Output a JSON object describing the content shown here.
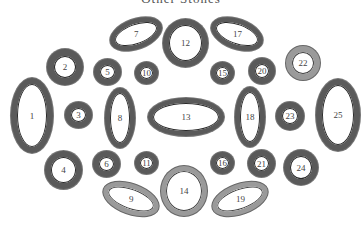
{
  "title": "Other Stones",
  "rings": [
    {
      "id": "1",
      "label": "1"
    },
    {
      "id": "2",
      "label": "2"
    },
    {
      "id": "3",
      "label": "3"
    },
    {
      "id": "4",
      "label": "4"
    },
    {
      "id": "5",
      "label": "5"
    },
    {
      "id": "6",
      "label": "6"
    },
    {
      "id": "7",
      "label": "7"
    },
    {
      "id": "8",
      "label": "8"
    },
    {
      "id": "9",
      "label": "9"
    },
    {
      "id": "10",
      "label": "10"
    },
    {
      "id": "11",
      "label": "11"
    },
    {
      "id": "12",
      "label": "12"
    },
    {
      "id": "13",
      "label": "13"
    },
    {
      "id": "14",
      "label": "14"
    },
    {
      "id": "15",
      "label": "15"
    },
    {
      "id": "16",
      "label": "16"
    },
    {
      "id": "17",
      "label": "17"
    },
    {
      "id": "18",
      "label": "18"
    },
    {
      "id": "19",
      "label": "19"
    },
    {
      "id": "20",
      "label": "20"
    },
    {
      "id": "21",
      "label": "21"
    },
    {
      "id": "22",
      "label": "22"
    },
    {
      "id": "23",
      "label": "23"
    },
    {
      "id": "24",
      "label": "24"
    },
    {
      "id": "25",
      "label": "25"
    }
  ]
}
